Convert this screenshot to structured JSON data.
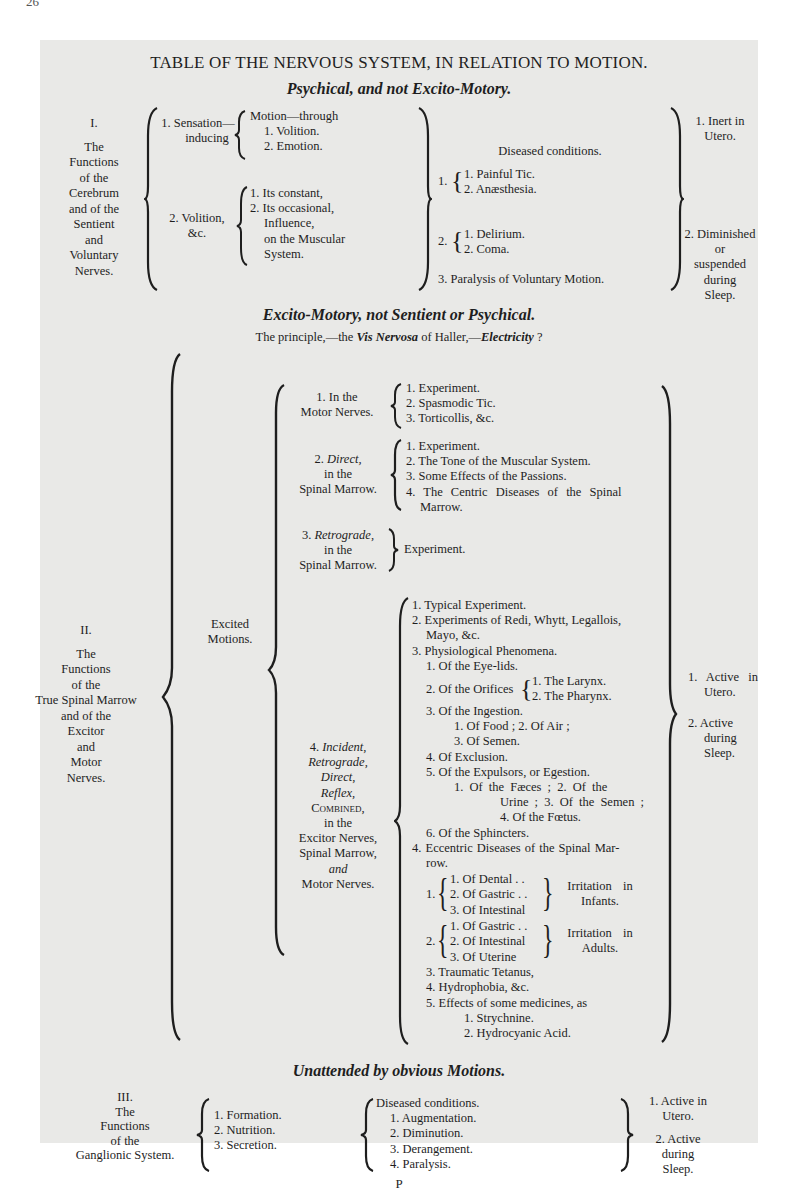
{
  "page": {
    "number": "26",
    "footer_signature": "P"
  },
  "table_title": "TABLE OF THE NERVOUS SYSTEM, IN RELATION TO MOTION.",
  "section1": {
    "heading": "Psychical, and not Excito-Motory.",
    "label": [
      "I.",
      "The",
      "Functions",
      "of the",
      "Cerebrum",
      "and of the",
      "Sentient",
      "and",
      "Voluntary",
      "Nerves."
    ],
    "branch1": {
      "title": [
        "1. Sensation—",
        "inducing"
      ],
      "items": [
        "Motion—through",
        "1. Volition.",
        "2. Emotion."
      ]
    },
    "branch2": {
      "title": [
        "2. Volition,",
        "&c."
      ],
      "items": [
        "1. Its constant,",
        "2. Its occasional,",
        "Influence,",
        "on the Muscular",
        "System."
      ]
    },
    "diseased": {
      "heading": "Diseased conditions.",
      "group1": {
        "num": "1.",
        "items": [
          "1. Painful Tic.",
          "2. Anæsthesia."
        ]
      },
      "group2": {
        "num": "2.",
        "items": [
          "1. Delirium.",
          "2. Coma."
        ]
      },
      "item3": "3. Paralysis of Voluntary Motion."
    },
    "states": {
      "a": [
        "1. Inert in",
        "Utero."
      ],
      "b": [
        "2. Diminished",
        "or",
        "suspended",
        "during",
        "Sleep."
      ]
    }
  },
  "section2": {
    "heading": "Excito-Motory, not Sentient or Psychical.",
    "principle": {
      "pre": "The principle,—the ",
      "vis": "Vis Nervosa",
      "mid": " of Haller,—",
      "elec": "Electricity",
      "end": " ?"
    },
    "label": [
      "II.",
      "The",
      "Functions",
      "of the",
      "True Spinal Marrow",
      "and of the",
      "Excitor",
      "and",
      "Motor",
      "Nerves."
    ],
    "excited": [
      "Excited",
      "Motions."
    ],
    "sub1": {
      "title": [
        "1. In the",
        "Motor Nerves."
      ],
      "items": [
        "1. Experiment.",
        "2. Spasmodic Tic.",
        "3. Torticollis, &c."
      ]
    },
    "sub2": {
      "title_num": "2.",
      "title_it": "Direct,",
      "title_rest": [
        "in the",
        "Spinal Marrow."
      ],
      "items": [
        "1. Experiment.",
        "2. The Tone of the Muscular System.",
        "3. Some Effects of the Passions.",
        "4. The Centric Diseases of the Spinal",
        "Marrow."
      ]
    },
    "sub3": {
      "title_num": "3.",
      "title_it": "Retrograde,",
      "title_rest": [
        "in the",
        "Spinal Marrow."
      ],
      "items": [
        "Experiment."
      ]
    },
    "sub4": {
      "title": {
        "num": "4.",
        "incident": "Incident,",
        "retro": "Retrograde,",
        "direct": "Direct,",
        "reflex": "Reflex,",
        "combined": "Combined,",
        "in_the": "in the",
        "excitor": "Excitor Nerves,",
        "spinal": "Spinal Marrow,",
        "and": "and",
        "motor": "Motor Nerves."
      },
      "items": {
        "i1": "1. Typical Experiment.",
        "i2a": "2. Experiments of Redi, Whytt, Legallois,",
        "i2b": "Mayo, &c.",
        "i3": "3. Physiological Phenomena.",
        "p1": "1. Of the Eye-lids.",
        "p2": "2. Of the Orifices",
        "p2_items": [
          "1. The Larynx.",
          "2. The Pharynx."
        ],
        "p3": "3. Of the Ingestion.",
        "p3a": "1. Of Food ; 2. Of Air ;",
        "p3b": "3. Of Semen.",
        "p4": "4. Of Exclusion.",
        "p5": "5. Of the Expulsors, or Egestion.",
        "p5a": "1. Of the Fæces ; 2. Of the",
        "p5b": "Urine ; 3. Of the Semen ;",
        "p5c": "4. Of the Fœtus.",
        "p6": "6. Of the Sphincters.",
        "i4a": "4. Eccentric Diseases of the Spinal Mar-",
        "i4b": "row.",
        "e1_num": "1.",
        "e1_items": [
          "1. Of Dental . .",
          "2. Of Gastric . .",
          "3. Of Intestinal"
        ],
        "e1_label": [
          "Irritation in",
          "Infants."
        ],
        "e2_num": "2.",
        "e2_items": [
          "1. Of Gastric . .",
          "2. Of Intestinal",
          "3. Of Uterine"
        ],
        "e2_label": [
          "Irritation in",
          "Adults."
        ],
        "e3": "3. Traumatic Tetanus,",
        "e4": "4. Hydrophobia, &c.",
        "e5": "5. Effects of some medicines, as",
        "e5a": "1. Strychnine.",
        "e5b": "2. Hydrocyanic Acid."
      }
    },
    "states": {
      "a": [
        "1. Active in",
        "Utero."
      ],
      "b": [
        "2. Active",
        "during",
        "Sleep."
      ]
    }
  },
  "section3": {
    "heading": "Unattended by obvious Motions.",
    "label": [
      "III.",
      "The",
      "Functions",
      "of the",
      "Ganglionic System."
    ],
    "items": [
      "1. Formation.",
      "2. Nutrition.",
      "3. Secretion."
    ],
    "diseased": [
      "Diseased conditions.",
      "1. Augmentation.",
      "2. Diminution.",
      "3. Derangement.",
      "4. Paralysis."
    ],
    "states": {
      "a": [
        "1. Active in",
        "Utero."
      ],
      "b": [
        "2. Active",
        "during",
        "Sleep."
      ]
    }
  }
}
